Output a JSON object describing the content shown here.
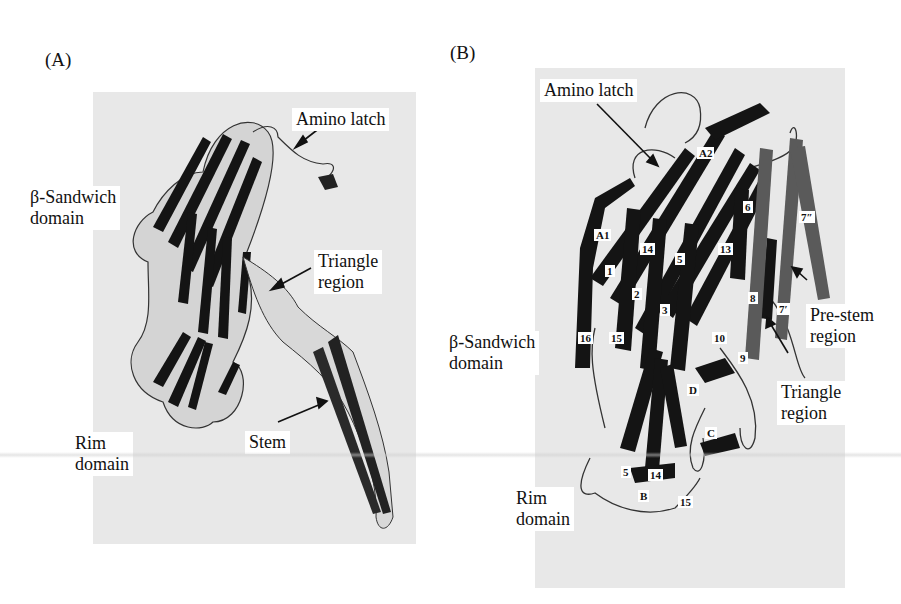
{
  "figure": {
    "panels": [
      {
        "id": "A",
        "label": "(A)",
        "callouts": {
          "amino_latch": "Amino latch",
          "beta_sandwich": "β-Sandwich\ndomain",
          "triangle": "Triangle\nregion",
          "rim": "Rim\ndomain",
          "stem": "Stem"
        }
      },
      {
        "id": "B",
        "label": "(B)",
        "callouts": {
          "amino_latch": "Amino latch",
          "beta_sandwich": "β-Sandwich\ndomain",
          "triangle": "Triangle\nregion",
          "pre_stem": "Pre-stem\nregion",
          "rim": "Rim\ndomain"
        },
        "strand_labels": [
          "A2",
          "6",
          "7″",
          "A1",
          "14",
          "13",
          "5",
          "1",
          "2",
          "3",
          "8",
          "7′",
          "16",
          "15",
          "10",
          "9",
          "D",
          "C",
          "5",
          "14",
          "B",
          "15"
        ]
      }
    ]
  },
  "colors": {
    "panel_background": "#e8e8e8",
    "strand_dark": "#141414",
    "strand_grey": "#5a5a5a",
    "coil": "#333333"
  }
}
